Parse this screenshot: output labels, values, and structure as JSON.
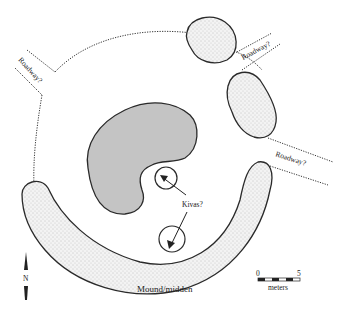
{
  "figure": {
    "type": "archaeological site plan",
    "colors": {
      "outline": "#2a2a2a",
      "roomblock_fill": "#c4c4c4",
      "stipple_fill": "#efefef",
      "background": "#ffffff"
    }
  },
  "labels": {
    "roadway_nw": "Roadway?",
    "roadway_ne": "Roadway?",
    "roadway_e": "Roadway?",
    "kivas": "Kivas?",
    "mound": "Mound/midden",
    "north": "N"
  },
  "scale_bar": {
    "start": "0",
    "end": "5",
    "unit": "meters"
  }
}
